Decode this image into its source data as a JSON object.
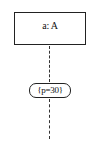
{
  "diagram": {
    "type": "uml-sequence-lifeline",
    "lifeline": {
      "label": "a: A"
    },
    "state_invariant": {
      "label": "{p=30}"
    },
    "caption_cut": "",
    "colors": {
      "stroke": "#222222",
      "background": "#ffffff",
      "text": "#111111"
    }
  }
}
